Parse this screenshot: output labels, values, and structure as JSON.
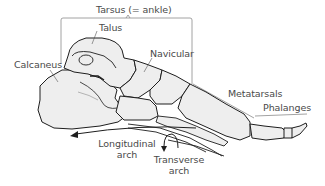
{
  "diagram": {
    "colors": {
      "bone_fill": "#eeeeee",
      "outline": "#1e1e1e",
      "text": "#4a4a4a",
      "bracket": "#8a8a8a"
    },
    "labels": {
      "tarsus": "Tarsus (= ankle)",
      "talus": "Talus",
      "navicular": "Navicular",
      "calcaneus": "Calcaneus",
      "metatarsals": "Metatarsals",
      "phalanges": "Phalanges",
      "longitudinal_line1": "Longitudinal",
      "longitudinal_line2": "arch",
      "transverse_line1": "Transverse",
      "transverse_line2": "arch"
    }
  }
}
